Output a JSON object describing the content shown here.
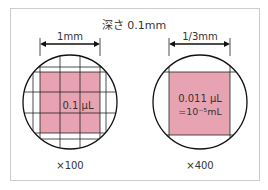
{
  "title": "深さ 0.1mm",
  "left": {
    "dimension_label": "1mm",
    "volume_label": "0.1 μL",
    "magnification": "×100"
  },
  "right": {
    "dimension_label": "1/3mm",
    "volume_line1": "0.011 μL",
    "volume_line2": "=10⁻⁵mL",
    "magnification": "×400"
  },
  "colors": {
    "pink_fill": "#e8a3b2",
    "frame": "#cccccc",
    "line": "#111111"
  }
}
